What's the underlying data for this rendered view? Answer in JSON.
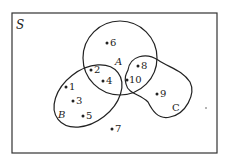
{
  "diagram": {
    "type": "venn",
    "universe_label": "S",
    "sets": [
      {
        "name": "A",
        "label": "A"
      },
      {
        "name": "B",
        "label": "B"
      },
      {
        "name": "C",
        "label": "C"
      }
    ],
    "elements": [
      {
        "label": "1",
        "regions": [
          "B"
        ]
      },
      {
        "label": "2",
        "regions": [
          "A",
          "B"
        ]
      },
      {
        "label": "3",
        "regions": [
          "B"
        ]
      },
      {
        "label": "4",
        "regions": [
          "A",
          "B"
        ]
      },
      {
        "label": "5",
        "regions": [
          "B"
        ]
      },
      {
        "label": "6",
        "regions": [
          "A"
        ]
      },
      {
        "label": "7",
        "regions": []
      },
      {
        "label": "8",
        "regions": [
          "A",
          "C"
        ]
      },
      {
        "label": "9",
        "regions": [
          "C"
        ]
      },
      {
        "label": "10",
        "regions": [
          "A",
          "C"
        ]
      }
    ],
    "colors": {
      "stroke": "#222222",
      "background": "#ffffff"
    }
  }
}
